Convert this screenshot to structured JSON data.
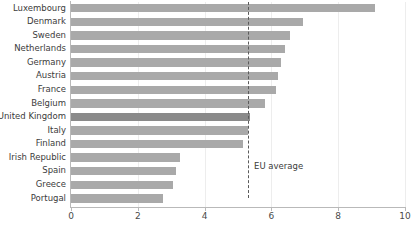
{
  "chart_data": {
    "type": "bar",
    "orientation": "horizontal",
    "title": "",
    "subtitle": "",
    "xlabel": "",
    "ylabel": "",
    "xlim": [
      0,
      10
    ],
    "ylim": null,
    "grid": true,
    "legend": null,
    "tick_labels": [
      "0",
      "2",
      "4",
      "6",
      "8",
      "10"
    ],
    "ticks": [
      0,
      2,
      4,
      6,
      8,
      10
    ],
    "categories": [
      "Luxembourg",
      "Denmark",
      "Sweden",
      "Netherlands",
      "Germany",
      "Austria",
      "France",
      "Belgium",
      "United Kingdom",
      "Italy",
      "Finland",
      "Irish Republic",
      "Spain",
      "Greece",
      "Portugal"
    ],
    "values": [
      9.1,
      6.95,
      6.55,
      6.4,
      6.3,
      6.2,
      6.15,
      5.8,
      5.35,
      5.3,
      5.15,
      3.25,
      3.15,
      3.05,
      2.75
    ],
    "highlighted_category": "United Kingdom",
    "annotations": [
      {
        "label": "EU average",
        "value": 5.3,
        "style": "dashed-vertical-line"
      }
    ],
    "colors": {
      "bar": "#a9a9a9",
      "bar_highlight": "#8a8a8a",
      "axis": "#b9b9b9",
      "gridline": "#ededed",
      "text": "#3b3b3b",
      "reference_line": "#5a5a5a",
      "background": "#ffffff"
    }
  }
}
